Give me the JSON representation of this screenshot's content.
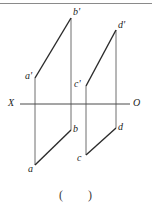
{
  "figure": {
    "title_rule_color": "#8a8a8a",
    "line_color": "#2b2b2b",
    "axis_color": "#4a4a4a",
    "projector_color": "#6e6e6e",
    "axis": {
      "left_label": "X",
      "right_label": "O",
      "y": 104,
      "x_start": 20,
      "x_end": 130
    },
    "points": [
      {
        "id": "a-prime",
        "label": "a'",
        "x": 35,
        "y": 78,
        "label_x": 25,
        "label_y": 71
      },
      {
        "id": "b-prime",
        "label": "b'",
        "x": 71,
        "y": 18,
        "label_x": 73,
        "label_y": 7
      },
      {
        "id": "c-prime",
        "label": "c'",
        "x": 86,
        "y": 86,
        "label_x": 74,
        "label_y": 79
      },
      {
        "id": "d-prime",
        "label": "d'",
        "x": 116,
        "y": 30,
        "label_x": 118,
        "label_y": 20
      },
      {
        "id": "a",
        "label": "a",
        "x": 35,
        "y": 165,
        "label_x": 28,
        "label_y": 164
      },
      {
        "id": "b",
        "label": "b",
        "x": 71,
        "y": 130,
        "label_x": 73,
        "label_y": 124
      },
      {
        "id": "c",
        "label": "c",
        "x": 86,
        "y": 155,
        "label_x": 77,
        "label_y": 153
      },
      {
        "id": "d",
        "label": "d",
        "x": 116,
        "y": 128,
        "label_x": 118,
        "label_y": 122
      }
    ],
    "segments": [
      {
        "id": "seg-a-prime-b-prime",
        "from": "a-prime",
        "to": "b-prime",
        "kind": "front-view"
      },
      {
        "id": "seg-c-prime-d-prime",
        "from": "c-prime",
        "to": "d-prime",
        "kind": "front-view"
      },
      {
        "id": "seg-a-b",
        "from": "a",
        "to": "b",
        "kind": "top-view"
      },
      {
        "id": "seg-c-d",
        "from": "c",
        "to": "d",
        "kind": "top-view"
      }
    ],
    "projectors": [
      {
        "id": "projector-a",
        "x": 35,
        "y1": 78,
        "y2": 165
      },
      {
        "id": "projector-b",
        "x": 71,
        "y1": 18,
        "y2": 130
      },
      {
        "id": "projector-c",
        "x": 86,
        "y1": 86,
        "y2": 155
      },
      {
        "id": "projector-d",
        "x": 116,
        "y1": 30,
        "y2": 128
      }
    ],
    "top_rule": {
      "y": 3,
      "x_start": 0,
      "x_end": 152
    },
    "answer_blank": "(      )"
  }
}
